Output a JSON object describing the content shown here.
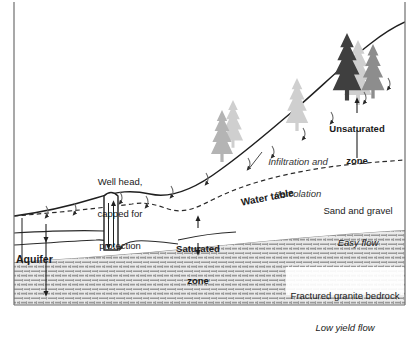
{
  "figure": {
    "kind": "hydrogeology-cross-section",
    "border_color": "#6e6e6e",
    "line_color": "#1f1f1f",
    "tree_dark": "#3f3f3f",
    "tree_mid": "#8d8d8d",
    "tree_light": "#cfcfcf",
    "bedrock_hatch": "#9a9a9a",
    "bedrock_fill": "#ebebeb"
  },
  "labels": {
    "well_head": {
      "line1": "Well head,",
      "line2": "capped for",
      "line3": "protection"
    },
    "aquifer": "Aquifer",
    "saturated_zone": {
      "line1": "Saturated",
      "line2": "zone"
    },
    "unsaturated_zone": {
      "line1": "Unsaturated",
      "line2": "zone"
    },
    "infiltration": {
      "line1": "Infiltration and",
      "line2": "percolation"
    },
    "water_table": "Water table",
    "sand_gravel": {
      "line1": "Sand and gravel",
      "line2": "Easy flow"
    },
    "bedrock": {
      "line1": "Fractured granite bedrock",
      "line2": "Low yield flow"
    }
  }
}
